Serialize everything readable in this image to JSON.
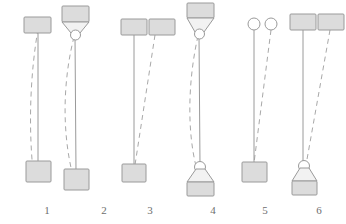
{
  "figure": {
    "width": 346,
    "height": 224,
    "background_color": "#ffffff",
    "stroke_color": "#9a9a9a",
    "fill_color": "#dcdcdc",
    "label_color": "#6e6e6e",
    "line_styles": {
      "solid": "initial position",
      "dashed": "displaced position"
    },
    "panels": [
      {
        "label": "1",
        "label_x": 47,
        "label_y": 214,
        "top_shape": "square",
        "bottom_shape": "square",
        "top_count": 1,
        "bottom_count": 1,
        "has_top_funnel": false,
        "has_bottom_funnel": false,
        "top_circle": false,
        "bottom_circle": false
      },
      {
        "label": "2",
        "label_x": 104,
        "label_y": 214,
        "top_shape": "square",
        "bottom_shape": "square",
        "top_count": 1,
        "bottom_count": 1,
        "has_top_funnel": true,
        "has_bottom_funnel": false,
        "top_circle": true,
        "bottom_circle": false
      },
      {
        "label": "3",
        "label_x": 150,
        "label_y": 214,
        "top_shape": "square",
        "bottom_shape": "square",
        "top_count": 2,
        "bottom_count": 1,
        "has_top_funnel": false,
        "has_bottom_funnel": false,
        "top_circle": false,
        "bottom_circle": false
      },
      {
        "label": "4",
        "label_x": 213,
        "label_y": 214,
        "top_shape": "square",
        "bottom_shape": "square",
        "top_count": 1,
        "bottom_count": 1,
        "has_top_funnel": true,
        "has_bottom_funnel": true,
        "top_circle": true,
        "bottom_circle": true
      },
      {
        "label": "5",
        "label_x": 265,
        "label_y": 214,
        "top_shape": "circle",
        "bottom_shape": "square",
        "top_count": 2,
        "bottom_count": 1,
        "has_top_funnel": false,
        "has_bottom_funnel": false,
        "top_circle": false,
        "bottom_circle": false
      },
      {
        "label": "6",
        "label_x": 319,
        "label_y": 214,
        "top_shape": "square",
        "bottom_shape": "square",
        "top_count": 2,
        "bottom_count": 1,
        "has_top_funnel": false,
        "has_bottom_funnel": true,
        "top_circle": false,
        "bottom_circle": true
      }
    ]
  }
}
